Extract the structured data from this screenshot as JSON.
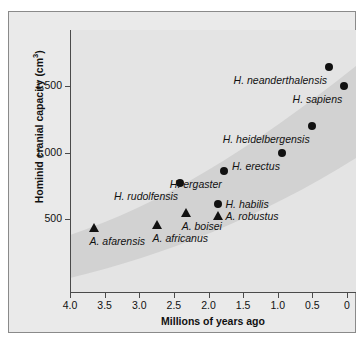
{
  "chart_data": {
    "type": "scatter",
    "title": "",
    "xlabel": "Millions of years ago",
    "ylabel": "Hominid cranial capacity (cm3)",
    "ylabel_main": "Hominid cranial capacity (cm",
    "ylabel_sup": "3",
    "ylabel_tail": ")",
    "xlim": [
      4.0,
      0
    ],
    "ylim": [
      0,
      1800
    ],
    "x_reversed": true,
    "grid": false,
    "legend": "none",
    "xticks": [
      "4.0",
      "3.5",
      "3.0",
      "2.5",
      "2.0",
      "1.5",
      "1.0",
      "0.5",
      "0"
    ],
    "xtick_values": [
      4.0,
      3.5,
      3.0,
      2.5,
      2.0,
      1.5,
      1.0,
      0.5,
      0
    ],
    "yticks": [
      "500",
      "1,000",
      "1,500"
    ],
    "ytick_values": [
      500,
      1000,
      1500
    ],
    "points": [
      {
        "name": "A. afarensis",
        "x": 3.66,
        "y": 430,
        "marker": "triangle",
        "label_pos": "below-right"
      },
      {
        "name": "A. africanus",
        "x": 2.75,
        "y": 455,
        "marker": "triangle",
        "label_pos": "below-right"
      },
      {
        "name": "A. boisei",
        "x": 2.33,
        "y": 545,
        "marker": "triangle",
        "label_pos": "below-right"
      },
      {
        "name": "A. robustus",
        "x": 1.87,
        "y": 520,
        "marker": "triangle",
        "label_pos": "right"
      },
      {
        "name": "H. habilis",
        "x": 1.87,
        "y": 610,
        "marker": "circle",
        "label_pos": "right"
      },
      {
        "name": "H. rudolfensis",
        "x": 2.41,
        "y": 770,
        "marker": "circle",
        "label_pos": "below-left"
      },
      {
        "name": "H. ergaster",
        "x": 1.78,
        "y": 860,
        "marker": "circle",
        "label_pos": "below-left"
      },
      {
        "name": "H. erectus",
        "x": 0.94,
        "y": 1000,
        "marker": "circle",
        "label_pos": "below-left"
      },
      {
        "name": "H. heidelbergensis",
        "x": 0.51,
        "y": 1200,
        "marker": "circle",
        "label_pos": "below-left"
      },
      {
        "name": "H. sapiens",
        "x": 0.04,
        "y": 1500,
        "marker": "circle",
        "label_pos": "below-left"
      },
      {
        "name": "H. neanderthalensis",
        "x": 0.26,
        "y": 1640,
        "marker": "circle",
        "label_pos": "below-left"
      }
    ],
    "band": {
      "description": "shaded trend band widening toward the present",
      "color": "#d2d2d2"
    },
    "colors": {
      "plot_background": "#e4e4e4",
      "figure_background": "#eaeaea",
      "band": "#d2d2d2",
      "marker": "#111111",
      "axis": "#4a4a4a"
    }
  }
}
